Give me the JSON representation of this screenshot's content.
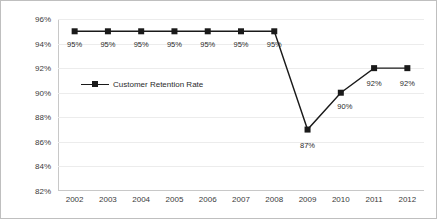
{
  "chart_data": {
    "type": "line",
    "title": "",
    "xlabel": "",
    "ylabel": "",
    "categories": [
      "2002",
      "2003",
      "2004",
      "2005",
      "2006",
      "2007",
      "2008",
      "2009",
      "2010",
      "2011",
      "2012"
    ],
    "series": [
      {
        "name": "Customer Retention Rate",
        "values": [
          95,
          95,
          95,
          95,
          95,
          95,
          95,
          87,
          90,
          92,
          92
        ],
        "point_labels": [
          "95%",
          "95%",
          "95%",
          "95%",
          "95%",
          "95%",
          "95%",
          "87%",
          "90%",
          "92%",
          "92%"
        ],
        "color": "#1a1a1a",
        "marker": "square"
      }
    ],
    "ylim": [
      82,
      96
    ],
    "ytick_values": [
      96,
      94,
      92,
      90,
      88,
      86,
      84,
      82
    ],
    "ytick_labels": [
      "96%",
      "94%",
      "92%",
      "90%",
      "88%",
      "86%",
      "84%",
      "82%"
    ],
    "grid": true,
    "legend": {
      "position": "inside-upper-left",
      "entries": [
        "Customer Retention Rate"
      ]
    }
  }
}
